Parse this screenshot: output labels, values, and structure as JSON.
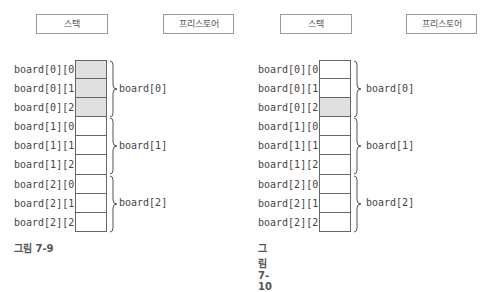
{
  "figures": [
    {
      "caption": "그림 7-9",
      "stack_label": "스택",
      "freestore_label": "프리스토어",
      "cells": [
        {
          "label": "board[0][0]",
          "shaded": true
        },
        {
          "label": "board[0][1]",
          "shaded": true
        },
        {
          "label": "board[0][2]",
          "shaded": true
        },
        {
          "label": "board[1][0]",
          "shaded": false
        },
        {
          "label": "board[1][1]",
          "shaded": false
        },
        {
          "label": "board[1][2]",
          "shaded": false
        },
        {
          "label": "board[2][0]",
          "shaded": false
        },
        {
          "label": "board[2][1]",
          "shaded": false
        },
        {
          "label": "board[2][2]",
          "shaded": false
        }
      ],
      "groups": [
        "board[0]",
        "board[1]",
        "board[2]"
      ]
    },
    {
      "caption": "그림 7-10",
      "stack_label": "스택",
      "freestore_label": "프리스토어",
      "cells": [
        {
          "label": "board[0][0]",
          "shaded": false
        },
        {
          "label": "board[0][1]",
          "shaded": false
        },
        {
          "label": "board[0][2]",
          "shaded": true
        },
        {
          "label": "board[1][0]",
          "shaded": false
        },
        {
          "label": "board[1][1]",
          "shaded": false
        },
        {
          "label": "board[1][2]",
          "shaded": false
        },
        {
          "label": "board[2][0]",
          "shaded": false
        },
        {
          "label": "board[2][1]",
          "shaded": false
        },
        {
          "label": "board[2][2]",
          "shaded": false
        }
      ],
      "groups": [
        "board[0]",
        "board[1]",
        "board[2]"
      ]
    }
  ],
  "colors": {
    "shaded_cell": "#e0e0e0",
    "border": "#666666",
    "text": "#444444"
  }
}
